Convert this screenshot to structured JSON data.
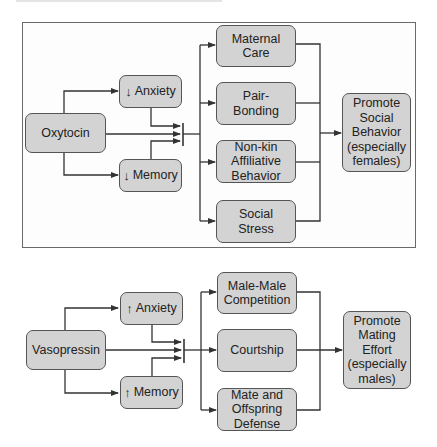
{
  "panels": [
    {
      "id": "oxytocin",
      "hormone": "Oxytocin",
      "modulators": [
        {
          "label": "Anxiety",
          "direction": "down",
          "glyph": "↓"
        },
        {
          "label": "Memory",
          "direction": "down",
          "glyph": "↓"
        }
      ],
      "behaviors": [
        {
          "label": "Maternal\nCare"
        },
        {
          "label": "Pair-\nBonding"
        },
        {
          "label": "Non-kin\nAffiliative\nBehavior"
        },
        {
          "label": "Social\nStress"
        }
      ],
      "outcome": "Promote\nSocial\nBehavior\n(especially\nfemales)"
    },
    {
      "id": "vasopressin",
      "hormone": "Vasopressin",
      "modulators": [
        {
          "label": "Anxiety",
          "direction": "up",
          "glyph": "↑"
        },
        {
          "label": "Memory",
          "direction": "up",
          "glyph": "↑"
        }
      ],
      "behaviors": [
        {
          "label": "Male-Male\nCompetition"
        },
        {
          "label": "Courtship"
        },
        {
          "label": "Mate and\nOffspring\nDefense"
        }
      ],
      "outcome": "Promote\nMating\nEffort\n(especially\nmales)"
    }
  ],
  "colors": {
    "box_fill": "#d3d3d3",
    "box_border": "#555555",
    "line": "#333333",
    "panel_border": "#6a6a6a"
  }
}
